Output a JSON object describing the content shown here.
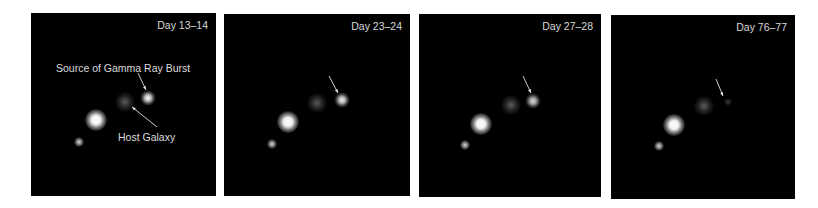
{
  "figure": {
    "panels": [
      {
        "day_label": "Day 13–14",
        "box": [
          31,
          13,
          185,
          183
        ],
        "objects": {
          "grb": [
            117,
            85,
            1.0
          ],
          "host": [
            94,
            89
          ],
          "bright_star": [
            65,
            107
          ],
          "small_star": [
            48,
            129
          ]
        },
        "arrow_grb": [
          107,
          60,
          115,
          77
        ],
        "arrow_host": [
          126,
          114,
          101,
          94
        ]
      },
      {
        "day_label": "Day 23–24",
        "box": [
          224,
          14,
          186,
          182
        ],
        "objects": {
          "grb": [
            118,
            86,
            0.95
          ],
          "host": [
            93,
            89
          ],
          "bright_star": [
            64,
            108
          ],
          "small_star": [
            48,
            130
          ]
        },
        "arrow_grb": [
          105,
          62,
          114,
          79
        ]
      },
      {
        "day_label": "Day 27–28",
        "box": [
          419,
          14,
          182,
          183
        ],
        "objects": {
          "grb": [
            114,
            87,
            0.85
          ],
          "host": [
            92,
            91
          ],
          "bright_star": [
            62,
            110
          ],
          "small_star": [
            46,
            131
          ]
        },
        "arrow_grb": [
          104,
          62,
          112,
          79
        ]
      },
      {
        "day_label": "Day 76–77",
        "box": [
          611,
          15,
          184,
          184
        ],
        "objects": {
          "grb": [
            117,
            87,
            0.2
          ],
          "host": [
            93,
            91
          ],
          "bright_star": [
            63,
            110
          ],
          "small_star": [
            48,
            131
          ]
        },
        "arrow_grb": [
          105,
          64,
          112,
          81
        ]
      }
    ],
    "annotations": {
      "grb_label": "Source of Gamma Ray Burst",
      "host_label": "Host Galaxy"
    },
    "colors": {
      "background": "#ffffff",
      "panel": "#000000",
      "text": "#dcdcdc"
    }
  }
}
